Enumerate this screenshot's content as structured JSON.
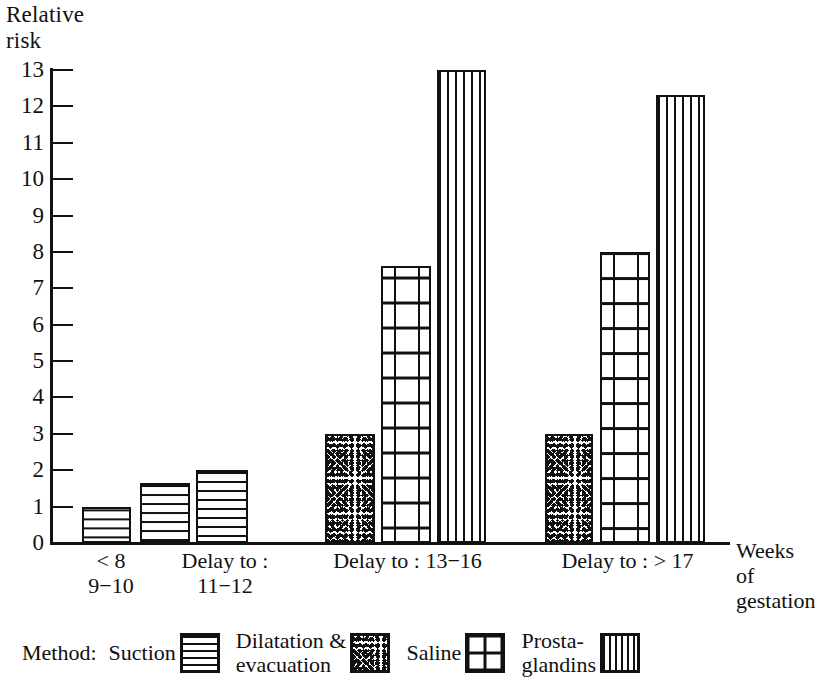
{
  "axis": {
    "y_title": "Relative\nrisk",
    "x_note": "Weeks of\ngestation",
    "y_ticks": [
      "0",
      "1",
      "2",
      "3",
      "4",
      "5",
      "6",
      "7",
      "8",
      "9",
      "10",
      "11",
      "12",
      "13"
    ]
  },
  "categories": [
    {
      "line1": "< 8",
      "line2": "9−10"
    },
    {
      "line1": "Delay to :",
      "line2": "11−12"
    },
    {
      "line1": "Delay to : 13−16",
      "line2": ""
    },
    {
      "line1": "Delay to : > 17",
      "line2": ""
    }
  ],
  "legend": {
    "title": "Method:",
    "items": [
      {
        "label": "Suction",
        "pattern": "horizontal-lines-swatch"
      },
      {
        "label": "Dilatation &\nevacuation",
        "pattern": "stipple-swatch"
      },
      {
        "label": "Saline",
        "pattern": "cross-grid-swatch"
      },
      {
        "label": "Prosta-\nglandins",
        "pattern": "vertical-lines-swatch"
      }
    ]
  },
  "chart_data": {
    "type": "bar",
    "title": "",
    "xlabel": "Weeks of gestation",
    "ylabel": "Relative risk",
    "ylim": [
      0,
      13
    ],
    "grid": false,
    "legend_position": "bottom",
    "categories": [
      "< 8",
      "Delay to : 9−10",
      "Delay to : 11−12",
      "Delay to : 13−16",
      "Delay to : > 17"
    ],
    "series": [
      {
        "name": "Suction",
        "values": [
          1,
          1.65,
          2,
          null,
          null
        ]
      },
      {
        "name": "Dilatation & evacuation",
        "values": [
          null,
          null,
          null,
          3,
          3
        ]
      },
      {
        "name": "Saline",
        "values": [
          null,
          null,
          null,
          7.6,
          8
        ]
      },
      {
        "name": "Prostaglandins",
        "values": [
          null,
          null,
          null,
          13,
          12.3
        ]
      }
    ],
    "bars": [
      {
        "group": "< 8",
        "series": "Suction",
        "value": 1
      },
      {
        "group": "Delay to : 9−10",
        "series": "Suction",
        "value": 1.65
      },
      {
        "group": "Delay to : 11−12",
        "series": "Suction",
        "value": 2
      },
      {
        "group": "Delay to : 13−16",
        "series": "Dilatation & evacuation",
        "value": 3
      },
      {
        "group": "Delay to : 13−16",
        "series": "Saline",
        "value": 7.6
      },
      {
        "group": "Delay to : 13−16",
        "series": "Prostaglandins",
        "value": 13
      },
      {
        "group": "Delay to : > 17",
        "series": "Dilatation & evacuation",
        "value": 3
      },
      {
        "group": "Delay to : > 17",
        "series": "Saline",
        "value": 8
      },
      {
        "group": "Delay to : > 17",
        "series": "Prostaglandins",
        "value": 12.3
      }
    ]
  },
  "colors": {
    "ink": "#111111",
    "paper": "#ffffff"
  }
}
